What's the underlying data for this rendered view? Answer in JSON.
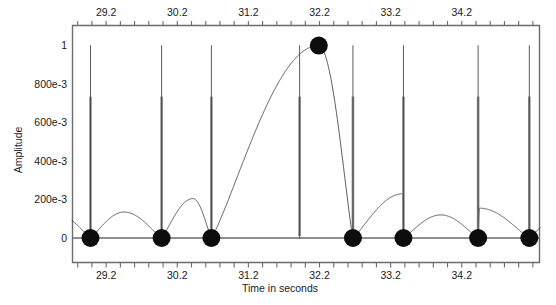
{
  "chart_data": {
    "type": "line",
    "title": "",
    "xlabel": "Time in seconds",
    "ylabel": "Amplitude",
    "xlim": [
      28.72,
      35.3
    ],
    "ylim": [
      -0.055,
      1.06
    ],
    "grid": false,
    "legend": null,
    "x_ticks_top": [
      29.2,
      30.2,
      31.2,
      32.2,
      33.2,
      34.2
    ],
    "x_ticks_bottom": [
      29.2,
      30.2,
      31.2,
      32.2,
      33.2,
      34.2
    ],
    "x_tick_labels_top": [
      "29.2",
      "30.2",
      "31.2",
      "32.2",
      "33.2",
      "34.2"
    ],
    "x_tick_labels_bottom": [
      "29.2",
      "30.2",
      "31.2",
      "32.2",
      "33.2",
      "34.2"
    ],
    "x_minor_tick_step": 0.2,
    "y_ticks": [
      0,
      0.2,
      0.4,
      0.6,
      0.8,
      1.0
    ],
    "y_tick_labels": [
      "0",
      "200e-3",
      "400e-3",
      "600e-3",
      "800e-3",
      "1"
    ],
    "series": [
      {
        "name": "ECG signal",
        "type": "line",
        "color": "#3d3d3d",
        "spike_times": [
          28.98,
          29.98,
          30.68,
          31.92,
          32.67,
          33.38,
          34.43,
          35.15
        ],
        "spike_amplitudes": [
          1.0,
          1.0,
          1.0,
          1.0,
          1.0,
          1.0,
          1.0,
          1.0
        ],
        "envelope_peaks": [
          {
            "t": 29.45,
            "a": 0.135
          },
          {
            "t": 30.42,
            "a": 0.205
          },
          {
            "t": 32.19,
            "a": 1.0
          },
          {
            "t": 33.37,
            "a": 0.23
          },
          {
            "t": 34.45,
            "a": 0.155
          }
        ],
        "baseline": 0.0
      }
    ],
    "markers": {
      "name": "detected peaks",
      "color": "#0d0d0d",
      "radius_px": 9,
      "points": [
        {
          "t": 28.98,
          "a": 0.0
        },
        {
          "t": 29.98,
          "a": 0.0
        },
        {
          "t": 30.68,
          "a": 0.0
        },
        {
          "t": 32.19,
          "a": 1.0
        },
        {
          "t": 32.67,
          "a": 0.0
        },
        {
          "t": 33.38,
          "a": 0.0
        },
        {
          "t": 34.43,
          "a": 0.0
        },
        {
          "t": 35.15,
          "a": 0.0
        }
      ]
    }
  },
  "axes": {
    "y_axis_title": "Amplitude",
    "x_axis_title": "Time in seconds",
    "y_tick_labels": [
      "1",
      "800e-3",
      "600e-3",
      "400e-3",
      "200e-3",
      "0"
    ],
    "x_tick_labels": [
      "29.2",
      "30.2",
      "31.2",
      "32.2",
      "33.2",
      "34.2"
    ]
  },
  "colors": {
    "background": "#ffffff",
    "axis": "#6b6b6b",
    "signal": "#3d3d3d",
    "spike_highlight": "#8c8c8c",
    "marker": "#0d0d0d",
    "text": "#1a1a1a"
  }
}
